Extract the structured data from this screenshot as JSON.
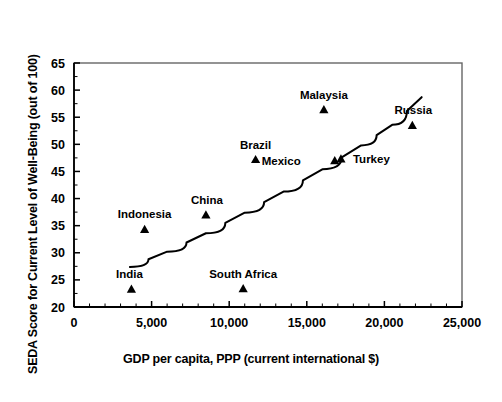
{
  "chart_data": {
    "type": "scatter",
    "title": "",
    "xlabel": "GDP per capita, PPP (current international $)",
    "ylabel": "SEDA Score for Current Level of Well-Being (out of 100)",
    "xlim": [
      0,
      25000
    ],
    "ylim": [
      20,
      65
    ],
    "xticks": [
      0,
      5000,
      10000,
      15000,
      20000,
      25000
    ],
    "xticklabels": [
      "0",
      "5,000",
      "10,000",
      "15,000",
      "20,000",
      "25,000"
    ],
    "yticks": [
      20,
      25,
      30,
      35,
      40,
      45,
      50,
      55,
      60,
      65
    ],
    "yticklabels": [
      "20",
      "25",
      "30",
      "35",
      "40",
      "45",
      "50",
      "55",
      "60",
      "65"
    ],
    "grid": false,
    "legend": "none",
    "marker": "triangle-up",
    "marker_color": "#000000",
    "points": [
      {
        "name": "India",
        "x": 3700,
        "y": 23.3,
        "label_dx": -2,
        "label_dy": -11
      },
      {
        "name": "Indonesia",
        "x": 4550,
        "y": 34.3,
        "label_dx": 0,
        "label_dy": -11
      },
      {
        "name": "China",
        "x": 8500,
        "y": 37.0,
        "label_dx": 1,
        "label_dy": -11
      },
      {
        "name": "South Africa",
        "x": 10900,
        "y": 23.4,
        "label_dx": 0,
        "label_dy": -11
      },
      {
        "name": "Brazil",
        "x": 11700,
        "y": 47.2,
        "label_dx": 0,
        "label_dy": -11
      },
      {
        "name": "Malaysia",
        "x": 16100,
        "y": 56.4,
        "label_dx": 0,
        "label_dy": -11
      },
      {
        "name": "Mexico",
        "x": 16800,
        "y": 47.0,
        "label_dx": -34,
        "label_dy": 4,
        "label_anchor": "end"
      },
      {
        "name": "Turkey",
        "x": 17200,
        "y": 47.3,
        "label_dx": 12,
        "label_dy": 4,
        "label_anchor": "start"
      },
      {
        "name": "Russia",
        "x": 21800,
        "y": 53.5,
        "label_dx": 1,
        "label_dy": -11
      }
    ],
    "trendline": {
      "type": "curve",
      "x_start": 3600,
      "y_start": 27.4,
      "x_end": 22400,
      "y_end": 58.7,
      "points": [
        {
          "x": 3600,
          "y": 27.4
        },
        {
          "x": 6000,
          "y": 30.2
        },
        {
          "x": 8500,
          "y": 33.6
        },
        {
          "x": 11000,
          "y": 37.4
        },
        {
          "x": 13500,
          "y": 41.3
        },
        {
          "x": 16000,
          "y": 45.4
        },
        {
          "x": 18500,
          "y": 49.8
        },
        {
          "x": 20500,
          "y": 53.6
        },
        {
          "x": 22400,
          "y": 58.7
        }
      ]
    },
    "axis_color": "#000000",
    "frame_color": "#666666",
    "background": "#ffffff"
  }
}
